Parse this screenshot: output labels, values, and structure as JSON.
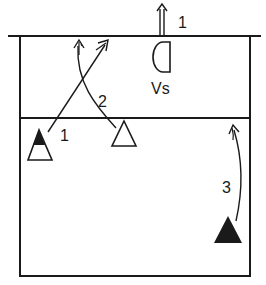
{
  "diagram": {
    "type": "volleyball court play diagram",
    "colors": {
      "ink": "#1a1a1a",
      "background": "#ffffff"
    },
    "labels": {
      "top_arrow": "1",
      "setter_zone": "Vs",
      "crossing_arrows": "2",
      "left_player": "1",
      "right_player": "3"
    },
    "elements": [
      {
        "id": "net-line",
        "desc": "net line at top of court"
      },
      {
        "id": "court-boundary",
        "desc": "court rectangle"
      },
      {
        "id": "attack-line",
        "desc": "3-meter line"
      },
      {
        "id": "vs-semicircle",
        "desc": "setter position marker (half circle)"
      },
      {
        "id": "player-left",
        "desc": "outline triangle with black top",
        "label": "1"
      },
      {
        "id": "player-center",
        "desc": "outline triangle"
      },
      {
        "id": "player-right",
        "desc": "solid black triangle",
        "label": "3"
      }
    ]
  }
}
